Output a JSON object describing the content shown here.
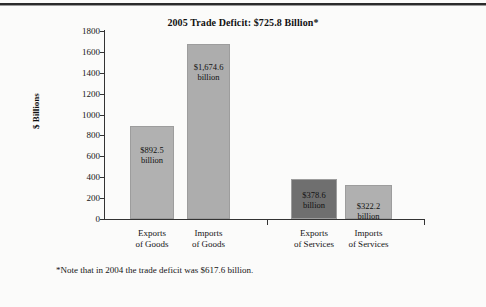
{
  "chart_data": {
    "type": "bar",
    "title": "2005 Trade Deficit: $725.8 Billion*",
    "xlabel": "",
    "ylabel": "$ Billions",
    "ylim": [
      0,
      1800
    ],
    "ytick_step": 200,
    "yticks": [
      "1800",
      "1600",
      "1400",
      "1200",
      "1000",
      "800",
      "600",
      "400",
      "200",
      "0"
    ],
    "grid": false,
    "legend": "none",
    "categories": [
      "Exports of Goods",
      "Imports of Goods",
      "Exports of Services",
      "Imports of Services"
    ],
    "values": [
      892.5,
      1674.6,
      378.6,
      322.2
    ],
    "bar_labels": [
      "$892.5 billion",
      "$1,674.6 billion",
      "$378.6 billion",
      "$322.2 billion"
    ],
    "annotation": "*Note that in 2004 the trade deficit was $617.6 billion."
  },
  "chart": {
    "title": "2005 Trade Deficit: $725.8 Billion*",
    "y_axis_title": "$ Billions",
    "yticks": [
      {
        "label": "1800",
        "value": 1800
      },
      {
        "label": "1600",
        "value": 1600
      },
      {
        "label": "1400",
        "value": 1400
      },
      {
        "label": "1200",
        "value": 1200
      },
      {
        "label": "1000",
        "value": 1000
      },
      {
        "label": "800",
        "value": 800
      },
      {
        "label": "600",
        "value": 600
      },
      {
        "label": "400",
        "value": 400
      },
      {
        "label": "200",
        "value": 200
      },
      {
        "label": "0",
        "value": 0
      }
    ],
    "bars": [
      {
        "name": "exports-of-goods",
        "value": 892.5,
        "value_line1": "$892.5",
        "value_line2": "billion",
        "category_line1": "Exports",
        "category_line2": "of Goods",
        "color": "#b1b1b1"
      },
      {
        "name": "imports-of-goods",
        "value": 1674.6,
        "value_line1": "$1,674.6",
        "value_line2": "billion",
        "category_line1": "Imports",
        "category_line2": "of Goods",
        "color": "#adadad"
      },
      {
        "name": "exports-of-services",
        "value": 378.6,
        "value_line1": "$378.6",
        "value_line2": "billion",
        "category_line1": "Exports",
        "category_line2": "of Services",
        "color": "#6f6f6f"
      },
      {
        "name": "imports-of-services",
        "value": 322.2,
        "value_line1": "$322.2",
        "value_line2": "billion",
        "category_line1": "Imports",
        "category_line2": "of Services",
        "color": "#b0b0b0"
      }
    ],
    "footnote": "*Note that in 2004 the trade deficit was $617.6 billion."
  }
}
